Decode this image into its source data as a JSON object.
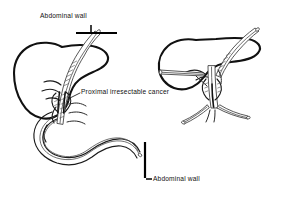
{
  "figure": {
    "background_color": "#ffffff",
    "ink_color": "#111111",
    "style": "black-and-white line drawing",
    "panels": [
      {
        "id": "left-panel",
        "name": "main-anatomical-view",
        "description": "Liver with transhepatic tube passing through proximal bile duct stricture into duodenal-jejunal loop"
      },
      {
        "id": "right-panel",
        "name": "detail-anatomical-view",
        "description": "Liver detail with multiple biliary catheters through hilar tumor"
      }
    ],
    "labels": [
      {
        "id": "label-abdominal-wall-top",
        "text": "Abdominal wall",
        "x": 40,
        "y": 18,
        "anchor": "start"
      },
      {
        "id": "label-proximal-cancer",
        "text": "Proximal irresectable cancer",
        "x": 81,
        "y": 94,
        "anchor": "start"
      },
      {
        "id": "label-abdominal-wall-bottom",
        "text": "Abdominal wall",
        "x": 153,
        "y": 181,
        "anchor": "start"
      }
    ],
    "annotations": {
      "wall_marker_top": "horizontal abdominal wall line with vertical tick, upper left",
      "wall_marker_bottom": "vertical abdominal wall line with horizontal tick, lower right",
      "catheter_tips": "open-ended catheter tips shown as small ellipses"
    }
  }
}
